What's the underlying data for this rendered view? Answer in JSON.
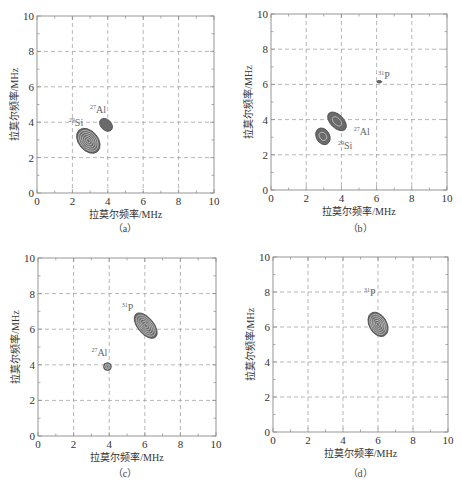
{
  "figure": {
    "colors": {
      "frame": "#8a8a8a",
      "grid": "#9a9a9a",
      "contour_fill": "#6a6a6a",
      "contour_line": "#d8d8d8",
      "label": "#666666",
      "tick_text": "#333333"
    }
  },
  "chart_data": [
    {
      "id": "a",
      "type": "contour",
      "caption": "（a）",
      "xlabel": "拉莫尔频率/MHz",
      "ylabel": "拉莫尔频率/MHz",
      "xlim": [
        0,
        10
      ],
      "ylim": [
        0,
        10
      ],
      "xticks": [
        0,
        2,
        4,
        6,
        8,
        10
      ],
      "yticks": [
        0,
        2,
        4,
        6,
        8,
        10
      ],
      "grid": true,
      "frame": {
        "x": 37,
        "y": 16,
        "w": 177,
        "h": 177
      },
      "peaks": [
        {
          "nucleus": "29Si",
          "mass": "29",
          "element": "Si",
          "cx": 2.9,
          "cy": 2.95,
          "rx": 0.55,
          "ry": 0.8,
          "angle": -40,
          "levels": 6,
          "label_x": 1.8,
          "label_y": 3.8
        },
        {
          "nucleus": "27Al",
          "mass": "27",
          "element": "Al",
          "cx": 3.9,
          "cy": 3.85,
          "rx": 0.3,
          "ry": 0.42,
          "angle": -45,
          "levels": 1,
          "label_x": 3.0,
          "label_y": 4.5
        }
      ]
    },
    {
      "id": "b",
      "type": "contour",
      "caption": "（b）",
      "xlabel": "拉莫尔频率/MHz",
      "ylabel": "拉莫尔频率/MHz",
      "xlim": [
        0,
        10
      ],
      "ylim": [
        0,
        10
      ],
      "xticks": [
        0,
        2,
        4,
        6,
        8,
        10
      ],
      "yticks": [
        0,
        2,
        4,
        6,
        8,
        10
      ],
      "grid": true,
      "frame": {
        "x": 271,
        "y": 14,
        "w": 176,
        "h": 176
      },
      "peaks": [
        {
          "nucleus": "29Si",
          "mass": "29",
          "element": "Si",
          "cx": 2.95,
          "cy": 3.05,
          "rx": 0.38,
          "ry": 0.5,
          "angle": -30,
          "levels": 2,
          "label_x": 3.8,
          "label_y": 2.35
        },
        {
          "nucleus": "27Al",
          "mass": "27",
          "element": "Al",
          "cx": 3.75,
          "cy": 3.9,
          "rx": 0.38,
          "ry": 0.65,
          "angle": -45,
          "levels": 2,
          "label_x": 4.7,
          "label_y": 3.1
        },
        {
          "nucleus": "31P",
          "mass": "31",
          "element": "P",
          "cx": 6.15,
          "cy": 6.15,
          "rx": 0.14,
          "ry": 0.07,
          "angle": 0,
          "levels": 1,
          "label_x": 6.1,
          "label_y": 6.3
        }
      ]
    },
    {
      "id": "c",
      "type": "contour",
      "caption": "（c）",
      "xlabel": "拉莫尔频率/MHz",
      "ylabel": "拉莫尔频率/MHz",
      "xlim": [
        0,
        10
      ],
      "ylim": [
        0,
        10
      ],
      "xticks": [
        0,
        2,
        4,
        6,
        8,
        10
      ],
      "yticks": [
        0,
        2,
        4,
        6,
        8,
        10
      ],
      "grid": true,
      "frame": {
        "x": 38,
        "y": 258,
        "w": 178,
        "h": 178
      },
      "peaks": [
        {
          "nucleus": "31P",
          "mass": "31",
          "element": "P",
          "cx": 6.05,
          "cy": 6.2,
          "rx": 0.45,
          "ry": 0.85,
          "angle": -40,
          "levels": 6,
          "label_x": 4.7,
          "label_y": 7.0
        },
        {
          "nucleus": "27Al",
          "mass": "27",
          "element": "Al",
          "cx": 3.9,
          "cy": 3.9,
          "rx": 0.22,
          "ry": 0.22,
          "angle": 0,
          "levels": 3,
          "label_x": 3.0,
          "label_y": 4.5
        }
      ]
    },
    {
      "id": "d",
      "type": "contour",
      "caption": "（d）",
      "xlabel": "拉莫尔频率/MHz",
      "ylabel": "拉莫尔频率/MHz",
      "xlim": [
        0,
        10
      ],
      "ylim": [
        0,
        10
      ],
      "xticks": [
        0,
        2,
        4,
        6,
        8,
        10
      ],
      "yticks": [
        0,
        2,
        4,
        6,
        8,
        10
      ],
      "grid": true,
      "frame": {
        "x": 273,
        "y": 257,
        "w": 175,
        "h": 175
      },
      "peaks": [
        {
          "nucleus": "31P",
          "mass": "31",
          "element": "P",
          "cx": 6.0,
          "cy": 6.15,
          "rx": 0.5,
          "ry": 0.75,
          "angle": -30,
          "levels": 6,
          "label_x": 5.2,
          "label_y": 7.75
        }
      ]
    }
  ]
}
